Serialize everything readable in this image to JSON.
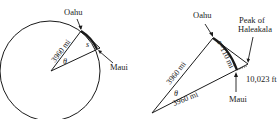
{
  "left_diagram": {
    "top_label": "Oahu",
    "right_label": "Maui",
    "radius_label": "3960 mi",
    "angle_label": "θ",
    "arc_label": "s"
  },
  "right_diagram": {
    "top_label": "Oahu",
    "peak_label_line1": "Peak of",
    "peak_label_line2": "Haleakala",
    "height_label": "10,023 ft",
    "bottom_label": "Maui",
    "left_side_label": "3960 mi",
    "bottom_side_label": "3960 mi",
    "arc_label": "s=110 mi",
    "angle_label": "θ"
  },
  "colors": {
    "stroke": "#1a1a1a",
    "background": "#ffffff"
  }
}
